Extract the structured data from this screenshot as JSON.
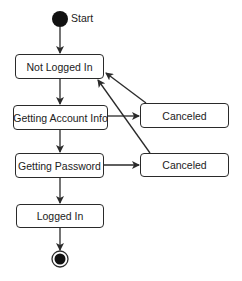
{
  "diagram": {
    "type": "state-machine",
    "start_label": "Start",
    "states": [
      {
        "id": "not-logged-in",
        "label": "Not Logged In"
      },
      {
        "id": "getting-account-info",
        "label": "Getting Account Info"
      },
      {
        "id": "getting-password",
        "label": "Getting Password"
      },
      {
        "id": "logged-in",
        "label": "Logged In"
      },
      {
        "id": "canceled-1",
        "label": "Canceled"
      },
      {
        "id": "canceled-2",
        "label": "Canceled"
      }
    ],
    "transitions": [
      {
        "from": "start",
        "to": "not-logged-in"
      },
      {
        "from": "not-logged-in",
        "to": "getting-account-info"
      },
      {
        "from": "getting-account-info",
        "to": "getting-password"
      },
      {
        "from": "getting-password",
        "to": "logged-in"
      },
      {
        "from": "logged-in",
        "to": "end"
      },
      {
        "from": "getting-account-info",
        "to": "canceled-1"
      },
      {
        "from": "getting-password",
        "to": "canceled-2"
      },
      {
        "from": "canceled-1",
        "to": "not-logged-in"
      },
      {
        "from": "canceled-2",
        "to": "not-logged-in"
      }
    ],
    "colors": {
      "stroke": "#2a2a2a",
      "fill": "#ffffff",
      "node": "#111111"
    }
  }
}
